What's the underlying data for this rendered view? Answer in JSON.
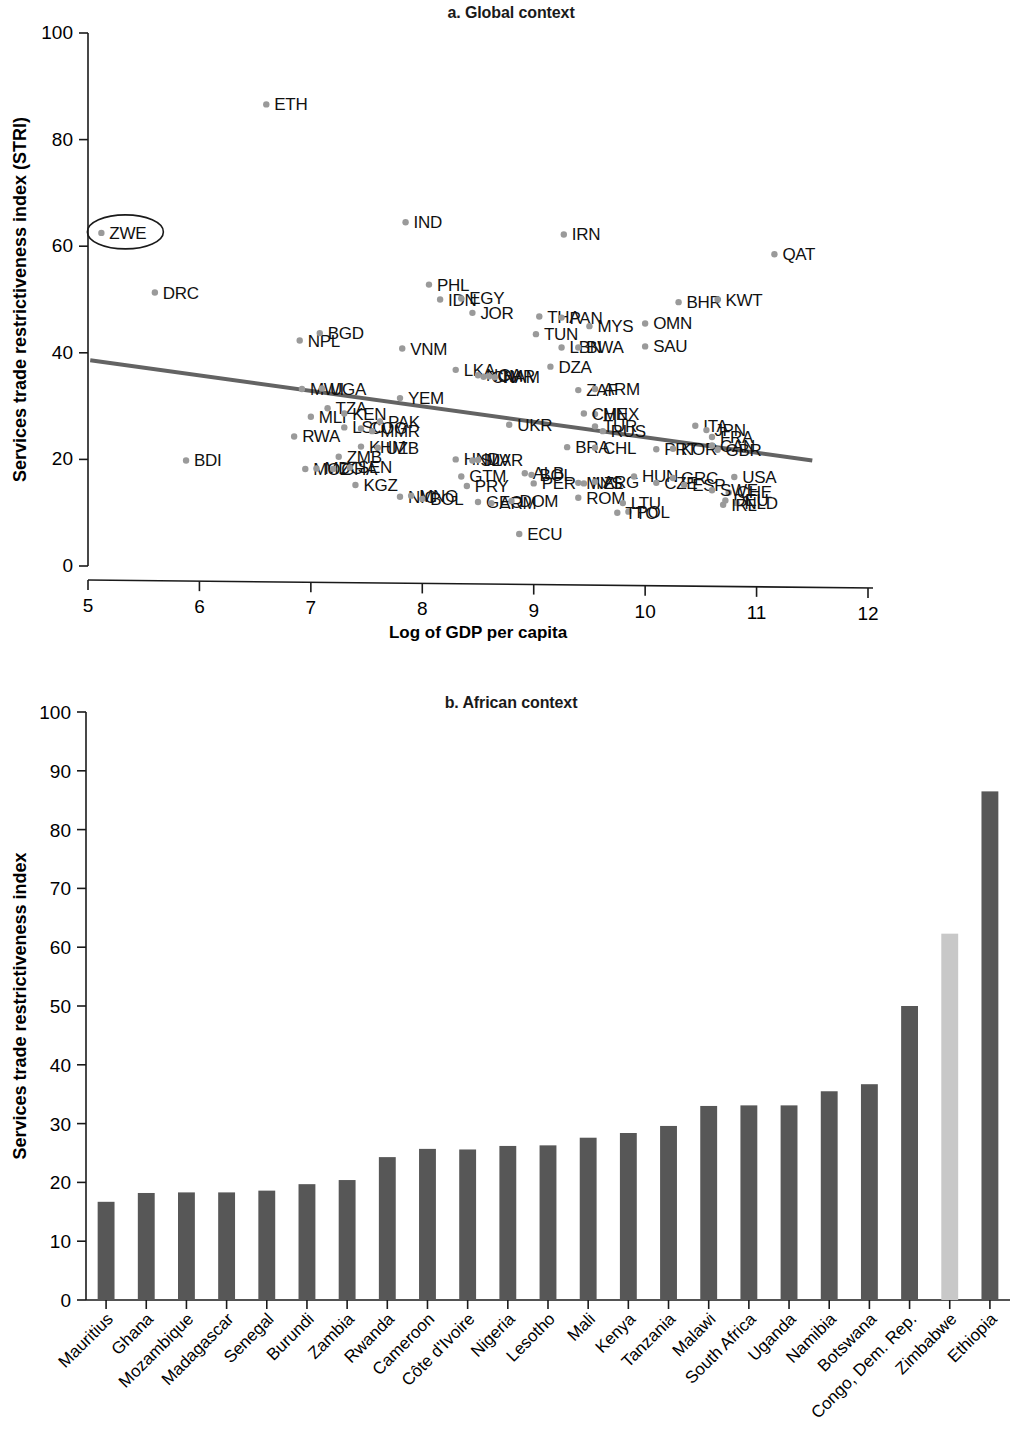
{
  "figure": {
    "panel_a_title": "a. Global context",
    "panel_b_title": "b. African context"
  },
  "chart_data": [
    {
      "type": "scatter",
      "panel": "a",
      "title": "a. Global context",
      "xlabel": "Log of GDP per capita",
      "ylabel": "Services trade restrictiveness index (STRI)",
      "xlim": [
        5,
        12
      ],
      "ylim": [
        0,
        100
      ],
      "xticks": [
        5,
        6,
        7,
        8,
        9,
        10,
        11,
        12
      ],
      "yticks": [
        0,
        20,
        40,
        60,
        80,
        100
      ],
      "grid": false,
      "legend": "none",
      "highlight": {
        "label": "ZWE",
        "marker": "ellipse",
        "x": 5.12,
        "y": 62.5
      },
      "trendline": {
        "x": [
          5.02,
          11.5
        ],
        "y": [
          38.6,
          19.8
        ]
      },
      "points": [
        {
          "label": "ZWE",
          "x": 5.12,
          "y": 62.5
        },
        {
          "label": "DRC",
          "x": 5.6,
          "y": 51.3
        },
        {
          "label": "BDI",
          "x": 5.88,
          "y": 19.8
        },
        {
          "label": "ETH",
          "x": 6.6,
          "y": 86.6
        },
        {
          "label": "NPL",
          "x": 6.9,
          "y": 42.3
        },
        {
          "label": "BGD",
          "x": 7.08,
          "y": 43.7
        },
        {
          "label": "MWI",
          "x": 6.92,
          "y": 33.2
        },
        {
          "label": "UGA",
          "x": 7.1,
          "y": 33.3
        },
        {
          "label": "MLI",
          "x": 7.0,
          "y": 28.0
        },
        {
          "label": "TZA",
          "x": 7.15,
          "y": 29.6
        },
        {
          "label": "KEN",
          "x": 7.3,
          "y": 28.6
        },
        {
          "label": "RWA",
          "x": 6.85,
          "y": 24.3
        },
        {
          "label": "LSO",
          "x": 7.3,
          "y": 26.0
        },
        {
          "label": "COG",
          "x": 7.45,
          "y": 25.8
        },
        {
          "label": "MMR",
          "x": 7.55,
          "y": 25.3
        },
        {
          "label": "PAK",
          "x": 7.62,
          "y": 27.1
        },
        {
          "label": "KHM",
          "x": 7.45,
          "y": 22.4
        },
        {
          "label": "UZB",
          "x": 7.6,
          "y": 22.2
        },
        {
          "label": "ZMB",
          "x": 7.25,
          "y": 20.5
        },
        {
          "label": "MOZ",
          "x": 6.95,
          "y": 18.2
        },
        {
          "label": "MDG",
          "x": 7.05,
          "y": 18.3
        },
        {
          "label": "GHA",
          "x": 7.2,
          "y": 18.2
        },
        {
          "label": "SEN",
          "x": 7.35,
          "y": 18.5
        },
        {
          "label": "KGZ",
          "x": 7.4,
          "y": 15.2
        },
        {
          "label": "NIC",
          "x": 7.8,
          "y": 13.0
        },
        {
          "label": "MNG",
          "x": 7.9,
          "y": 13.2
        },
        {
          "label": "BOL",
          "x": 8.0,
          "y": 12.6
        },
        {
          "label": "YEM",
          "x": 7.8,
          "y": 31.5
        },
        {
          "label": "VNM",
          "x": 7.82,
          "y": 40.8
        },
        {
          "label": "IND",
          "x": 7.85,
          "y": 64.5
        },
        {
          "label": "PHL",
          "x": 8.06,
          "y": 52.8
        },
        {
          "label": "IDN",
          "x": 8.16,
          "y": 50.0
        },
        {
          "label": "JOR",
          "x": 8.45,
          "y": 47.5
        },
        {
          "label": "EGY",
          "x": 8.35,
          "y": 50.2
        },
        {
          "label": "LKA",
          "x": 8.3,
          "y": 36.8
        },
        {
          "label": "NGA",
          "x": 8.5,
          "y": 35.8
        },
        {
          "label": "CIV",
          "x": 8.55,
          "y": 35.5
        },
        {
          "label": "CMR",
          "x": 8.6,
          "y": 35.6
        },
        {
          "label": "NAM",
          "x": 8.65,
          "y": 35.4
        },
        {
          "label": "HND",
          "x": 8.3,
          "y": 20.0
        },
        {
          "label": "SLV",
          "x": 8.45,
          "y": 19.8
        },
        {
          "label": "MAR",
          "x": 8.5,
          "y": 19.9
        },
        {
          "label": "GTM",
          "x": 8.35,
          "y": 16.8
        },
        {
          "label": "PRY",
          "x": 8.4,
          "y": 15.0
        },
        {
          "label": "GEO",
          "x": 8.5,
          "y": 12.0
        },
        {
          "label": "ARM",
          "x": 8.62,
          "y": 11.8
        },
        {
          "label": "DOM",
          "x": 8.8,
          "y": 12.2
        },
        {
          "label": "ECU",
          "x": 8.87,
          "y": 6.0
        },
        {
          "label": "UKR",
          "x": 8.78,
          "y": 26.5
        },
        {
          "label": "ALB",
          "x": 8.92,
          "y": 17.4
        },
        {
          "label": "BOL2",
          "x": 8.98,
          "y": 17.1
        },
        {
          "label": "PER",
          "x": 9.0,
          "y": 15.5
        },
        {
          "label": "THA",
          "x": 9.05,
          "y": 46.8
        },
        {
          "label": "TUN",
          "x": 9.02,
          "y": 43.5
        },
        {
          "label": "PAN",
          "x": 9.25,
          "y": 46.6
        },
        {
          "label": "LBN",
          "x": 9.25,
          "y": 41.0
        },
        {
          "label": "BWA",
          "x": 9.4,
          "y": 41.0
        },
        {
          "label": "DZA",
          "x": 9.15,
          "y": 37.4
        },
        {
          "label": "IRN",
          "x": 9.27,
          "y": 62.2
        },
        {
          "label": "MYS",
          "x": 9.5,
          "y": 45.0
        },
        {
          "label": "ZAF",
          "x": 9.4,
          "y": 33.0
        },
        {
          "label": "ARM2",
          "x": 9.55,
          "y": 33.2
        },
        {
          "label": "MEX",
          "x": 9.55,
          "y": 28.5
        },
        {
          "label": "CHN",
          "x": 9.45,
          "y": 28.6
        },
        {
          "label": "TUR",
          "x": 9.55,
          "y": 26.2
        },
        {
          "label": "RUS",
          "x": 9.62,
          "y": 25.3
        },
        {
          "label": "BRA",
          "x": 9.3,
          "y": 22.3
        },
        {
          "label": "CHL",
          "x": 9.55,
          "y": 22.2
        },
        {
          "label": "MYS2",
          "x": 9.4,
          "y": 15.6
        },
        {
          "label": "NZL",
          "x": 9.45,
          "y": 15.5
        },
        {
          "label": "ARG",
          "x": 9.55,
          "y": 15.8
        },
        {
          "label": "ROM",
          "x": 9.4,
          "y": 12.8
        },
        {
          "label": "HUN",
          "x": 9.9,
          "y": 16.8
        },
        {
          "label": "LTU",
          "x": 9.8,
          "y": 11.8
        },
        {
          "label": "POL",
          "x": 9.85,
          "y": 10.2
        },
        {
          "label": "OMN",
          "x": 10.0,
          "y": 45.5
        },
        {
          "label": "SAU",
          "x": 10.0,
          "y": 41.2
        },
        {
          "label": "PRT",
          "x": 10.1,
          "y": 21.9
        },
        {
          "label": "KOR",
          "x": 10.25,
          "y": 22.0
        },
        {
          "label": "BHR",
          "x": 10.3,
          "y": 49.5
        },
        {
          "label": "KWT",
          "x": 10.65,
          "y": 50.0
        },
        {
          "label": "CZE",
          "x": 10.1,
          "y": 15.6
        },
        {
          "label": "GRC",
          "x": 10.25,
          "y": 16.5
        },
        {
          "label": "ESP",
          "x": 10.35,
          "y": 15.2
        },
        {
          "label": "ITA",
          "x": 10.45,
          "y": 26.3
        },
        {
          "label": "JPN",
          "x": 10.55,
          "y": 25.5
        },
        {
          "label": "FRA",
          "x": 10.6,
          "y": 24.2
        },
        {
          "label": "CAN",
          "x": 10.6,
          "y": 22.6
        },
        {
          "label": "GBR",
          "x": 10.65,
          "y": 21.8
        },
        {
          "label": "USA",
          "x": 10.8,
          "y": 16.7
        },
        {
          "label": "CHE",
          "x": 10.75,
          "y": 13.8
        },
        {
          "label": "SWE",
          "x": 10.6,
          "y": 14.2
        },
        {
          "label": "DEU",
          "x": 10.72,
          "y": 12.3
        },
        {
          "label": "NLD",
          "x": 10.82,
          "y": 11.8
        },
        {
          "label": "IRL",
          "x": 10.7,
          "y": 11.5
        },
        {
          "label": "TTO",
          "x": 9.75,
          "y": 10.0
        },
        {
          "label": "QAT",
          "x": 11.16,
          "y": 58.5
        }
      ],
      "point_labels_visible": [
        "ZWE",
        "DRC",
        "BDI",
        "ETH",
        "NPL",
        "BGD",
        "MWI",
        "UGA",
        "MLI",
        "TZA",
        "KEN",
        "RWA",
        "LSO",
        "COG",
        "MMR",
        "PAK",
        "KHM",
        "UZB",
        "ZMB",
        "MOZ",
        "MDG",
        "GHA",
        "SEN",
        "KGZ",
        "NIC",
        "MNG",
        "BOL",
        "YEM",
        "VNM",
        "IND",
        "PHL",
        "IDN",
        "JOR",
        "EGY",
        "LKA",
        "NGA",
        "CIV",
        "CMR",
        "NAM",
        "HND",
        "SLV",
        "MAR",
        "GTM",
        "PRY",
        "GEO",
        "ARM",
        "DOM",
        "ECU",
        "UKR",
        "ALB",
        "PER",
        "THA",
        "TUN",
        "PAN",
        "LBN",
        "BWA",
        "DZA",
        "IRN",
        "MYS",
        "ZAF",
        "MEX",
        "CHN",
        "TUR",
        "RUS",
        "BRA",
        "CHL",
        "ARG",
        "ROM",
        "HUN",
        "LTU",
        "POL",
        "OMN",
        "SAU",
        "PRT",
        "KOR",
        "BHR",
        "KWT",
        "CZE",
        "GRC",
        "ESP",
        "ITA",
        "JPN",
        "FRA",
        "CAN",
        "GBR",
        "USA",
        "CHE",
        "SWE",
        "DEU",
        "NLD",
        "IRL",
        "TTO",
        "NZL",
        "QAT"
      ]
    },
    {
      "type": "bar",
      "panel": "b",
      "title": "b. African context",
      "xlabel": "",
      "ylabel": "Services trade restrictiveness index",
      "ylim": [
        0,
        100
      ],
      "yticks": [
        0,
        10,
        20,
        30,
        40,
        50,
        60,
        70,
        80,
        90,
        100
      ],
      "grid": false,
      "legend": "none",
      "highlight_category": "Zimbabwe",
      "bar_color": "#575757",
      "highlight_color": "#c8c8c8",
      "categories": [
        "Mauritius",
        "Ghana",
        "Mozambique",
        "Madagascar",
        "Senegal",
        "Burundi",
        "Zambia",
        "Rwanda",
        "Cameroon",
        "Côte d'Ivoire",
        "Nigeria",
        "Lesotho",
        "Mali",
        "Kenya",
        "Tanzania",
        "Malawi",
        "South Africa",
        "Uganda",
        "Namibia",
        "Botswana",
        "Congo, Dem. Rep.",
        "Zimbabwe",
        "Ethiopia"
      ],
      "values": [
        16.7,
        18.2,
        18.3,
        18.3,
        18.6,
        19.7,
        20.4,
        24.3,
        25.7,
        25.6,
        26.2,
        26.3,
        27.6,
        28.4,
        29.6,
        33.0,
        33.1,
        33.1,
        35.5,
        36.7,
        50.0,
        62.3,
        86.5
      ]
    }
  ]
}
